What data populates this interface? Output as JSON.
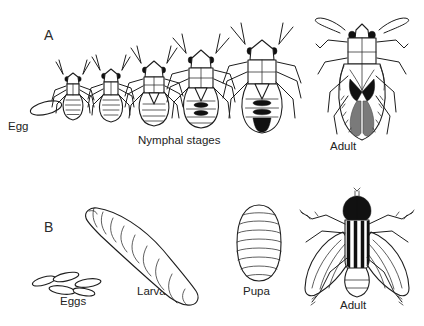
{
  "figure": {
    "background_color": "#ffffff",
    "ink_color": "#1d1d1d",
    "accent_dark": "#111111",
    "accent_gray": "#7a7a7a",
    "panels": [
      {
        "letter": "A",
        "caption_labels": [
          "Egg",
          "Nymphal stages",
          "Adult"
        ],
        "stage_names": [
          "Egg",
          "Nymphal stages",
          "Adult"
        ]
      },
      {
        "letter": "B",
        "caption_labels": [
          "Eggs",
          "Larva",
          "Pupa",
          "Adult"
        ],
        "stage_names": [
          "Eggs",
          "Larva",
          "Pupa",
          "Adult"
        ]
      }
    ]
  },
  "panelA": {
    "letter": "A",
    "egg_label": "Egg",
    "nymph_label": "Nymphal stages",
    "adult_label": "Adult",
    "nymph_count": 5
  },
  "panelB": {
    "letter": "B",
    "eggs_label": "Eggs",
    "larva_label": "Larva",
    "pupa_label": "Pupa",
    "adult_label": "Adult",
    "egg_count": 5
  }
}
